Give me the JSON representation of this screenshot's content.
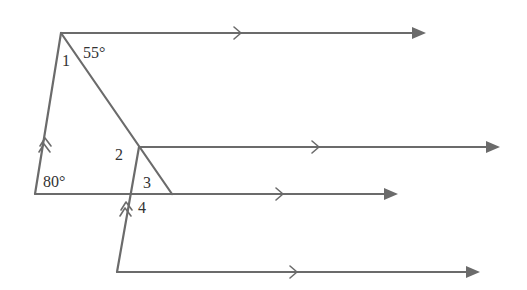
{
  "diagram": {
    "type": "geometry-parallel-lines",
    "angle_labels": {
      "angle_top_given": "55°",
      "angle_bottom_left_given": "80°",
      "angle_1": "1",
      "angle_2": "2",
      "angle_3": "3",
      "angle_4": "4"
    },
    "colors": {
      "line": "#6b6b6b",
      "text": "#333333",
      "background": "#ffffff"
    },
    "markers": {
      "single_arrow": "parallel-mark-single",
      "double_arrow": "parallel-mark-double"
    }
  }
}
